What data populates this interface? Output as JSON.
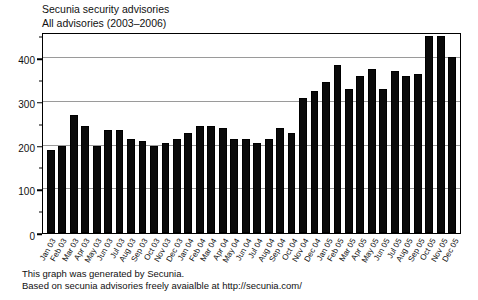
{
  "title": {
    "line1": "Secunia security advisories",
    "line2": "All advisories (2003–2006)"
  },
  "caption": {
    "line1": "This graph was generated by Secunia.",
    "line2": "Based on secunia advisories freely avaialble at http://secunia.com/"
  },
  "colors": {
    "bar": "#0a0a0a",
    "grid": "#9a9a9a",
    "frame": "#000000",
    "background": "#ffffff"
  },
  "axis": {
    "y_major_ticks": [
      0,
      100,
      200,
      300,
      400
    ],
    "y_minor_ticks": [
      50,
      150,
      250,
      350,
      450
    ],
    "y_tick_labels": [
      "0",
      "100",
      "200",
      "300",
      "400"
    ]
  },
  "chart_data": {
    "type": "bar",
    "title": "Secunia security advisories",
    "subtitle": "All advisories (2003–2006)",
    "xlabel": "",
    "ylabel": "",
    "ylim": [
      0,
      460
    ],
    "grid": true,
    "legend": "none",
    "categories": [
      "Jan 03",
      "Feb 03",
      "Mar 03",
      "Apr 03",
      "May 03",
      "Jun 03",
      "Jul 03",
      "Aug 03",
      "Sep 03",
      "Oct 03",
      "Nov 03",
      "Dec 03",
      "Jan 04",
      "Feb 04",
      "Mar 04",
      "Apr 04",
      "May 04",
      "Jun 04",
      "Jul 04",
      "Aug 04",
      "Sep 04",
      "Oct 04",
      "Nov 04",
      "Dec 04",
      "Jan 05",
      "Feb 05",
      "Mar 05",
      "Apr 05",
      "May 05",
      "Jun 05",
      "Jul 05",
      "Aug 05",
      "Sep 05",
      "Oct 05",
      "Nov 05",
      "Dec 05"
    ],
    "values": [
      190,
      200,
      270,
      245,
      200,
      235,
      235,
      215,
      210,
      200,
      205,
      215,
      230,
      245,
      245,
      240,
      215,
      215,
      205,
      215,
      240,
      230,
      310,
      325,
      345,
      385,
      330,
      360,
      375,
      330,
      370,
      360,
      365,
      450,
      450,
      402
    ],
    "series_name": "Advisories per month"
  }
}
